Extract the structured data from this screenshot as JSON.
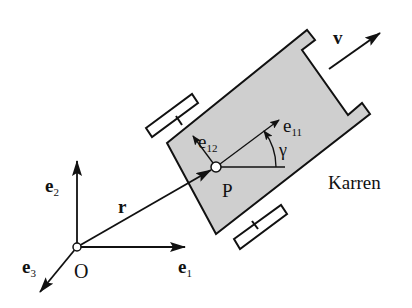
{
  "diagram": {
    "labels": {
      "velocity": "v",
      "e11": "e",
      "e11_sub": "11",
      "e12": "e",
      "e12_sub": "12",
      "gamma": "γ",
      "point_p": "P",
      "cart": "Karren",
      "position": "r",
      "e1": "e",
      "e1_sub": "1",
      "e2": "e",
      "e2_sub": "2",
      "e3": "e",
      "e3_sub": "3",
      "origin": "O"
    },
    "colors": {
      "cart_fill": "#cfcfcf",
      "stroke": "#111111",
      "background": "#ffffff"
    }
  }
}
